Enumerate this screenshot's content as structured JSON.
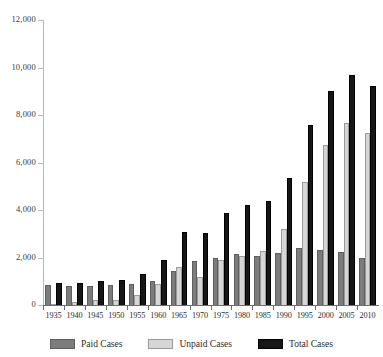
{
  "chart_data": {
    "type": "bar",
    "title": "",
    "subtitle": "",
    "xlabel": "",
    "ylabel": "",
    "ylim": [
      0,
      12000
    ],
    "ytick_step": 2000,
    "ytick_labels": [
      "0",
      "2,000",
      "4,000",
      "6,000",
      "8,000",
      "10,000",
      "12,000"
    ],
    "ytick_values": [
      0,
      2000,
      4000,
      6000,
      8000,
      10000,
      12000
    ],
    "grid": false,
    "legend_position": "bottom",
    "categories": [
      "1935",
      "1940",
      "1945",
      "1950",
      "1955",
      "1960",
      "1965",
      "1970",
      "1975",
      "1980",
      "1985",
      "1990",
      "1995",
      "2000",
      "2005",
      "2010"
    ],
    "series": [
      {
        "name": "Paid Cases",
        "color": "#7c7c7c",
        "values": [
          850,
          800,
          780,
          850,
          880,
          1020,
          1450,
          1850,
          1980,
          2150,
          2080,
          2180,
          2400,
          2320,
          2250,
          1980
        ]
      },
      {
        "name": "Unpaid Cases",
        "color": "#d6d6d6",
        "values": [
          60,
          110,
          220,
          210,
          420,
          880,
          1620,
          1180,
          1900,
          2080,
          2280,
          3180,
          5180,
          6720,
          7680,
          7250
        ]
      },
      {
        "name": "Total Cases",
        "color": "#161616",
        "values": [
          910,
          910,
          1000,
          1060,
          1300,
          1900,
          3070,
          3030,
          3880,
          4230,
          4360,
          5360,
          7580,
          9020,
          9700,
          9230
        ]
      }
    ]
  },
  "legend": {
    "items": [
      {
        "label": "Paid Cases",
        "swatch": "paid-cases-swatch"
      },
      {
        "label": "Unpaid Cases",
        "swatch": "unpaid-cases-swatch"
      },
      {
        "label": "Total Cases",
        "swatch": "total-cases-swatch"
      }
    ]
  }
}
